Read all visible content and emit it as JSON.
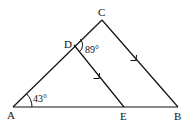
{
  "diagram": {
    "type": "geometry",
    "points": {
      "A": {
        "label": "A",
        "x": 13,
        "y": 107
      },
      "B": {
        "label": "B",
        "x": 178,
        "y": 107
      },
      "C": {
        "label": "C",
        "x": 102,
        "y": 20
      },
      "D": {
        "label": "D",
        "x": 74,
        "y": 45
      },
      "E": {
        "label": "E",
        "x": 124,
        "y": 107
      }
    },
    "segments": [
      "AC",
      "CB",
      "AB",
      "DE"
    ],
    "parallel": [
      "DE",
      "CB"
    ],
    "angles": {
      "A": {
        "label": "43°",
        "value": 43
      },
      "D": {
        "label": "89°",
        "value": 89
      }
    },
    "stroke_color": "#111111"
  }
}
